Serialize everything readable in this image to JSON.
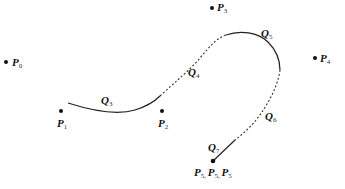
{
  "diagram": {
    "type": "b-spline-curve-segments",
    "control_points": [
      {
        "id": "P0",
        "letter": "P",
        "sub": "0"
      },
      {
        "id": "P1",
        "letter": "P",
        "sub": "1"
      },
      {
        "id": "P2",
        "letter": "P",
        "sub": "2"
      },
      {
        "id": "P3",
        "letter": "P",
        "sub": "3"
      },
      {
        "id": "P4",
        "letter": "P",
        "sub": "4"
      },
      {
        "id": "P5-triple",
        "letter": "P",
        "sub": "5",
        "label_sep": ", "
      }
    ],
    "segments": [
      {
        "id": "Q3",
        "letter": "Q",
        "sub": "3",
        "style": "solid"
      },
      {
        "id": "Q4",
        "letter": "Q",
        "sub": "4",
        "style": "dashed"
      },
      {
        "id": "Q5",
        "letter": "Q",
        "sub": "5",
        "style": "solid"
      },
      {
        "id": "Q6",
        "letter": "Q",
        "sub": "6",
        "style": "dashed"
      },
      {
        "id": "Q7",
        "letter": "Q",
        "sub": "7",
        "style": "solid"
      }
    ],
    "colors": {
      "ink": "#111111",
      "background": "#ffffff"
    }
  }
}
